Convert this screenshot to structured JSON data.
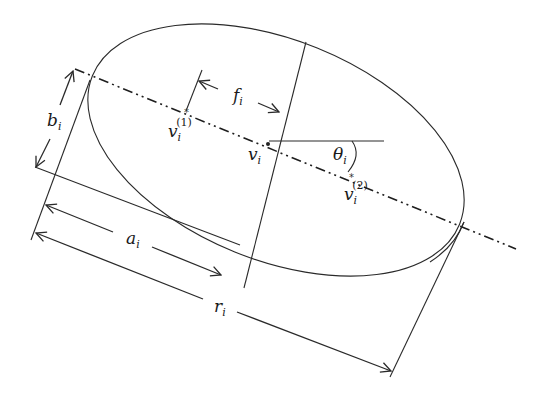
{
  "diagram": {
    "labels": {
      "b": {
        "base": "b",
        "sub": "i"
      },
      "f": {
        "base": "f",
        "sub": "i"
      },
      "v1": {
        "base": "v",
        "sub": "i",
        "sup": "(1)"
      },
      "v": {
        "base": "v",
        "sub": "i"
      },
      "theta": {
        "base": "θ",
        "sub": "i"
      },
      "v2": {
        "base": "v",
        "sub": "i",
        "sup": "(2)"
      },
      "a": {
        "base": "a",
        "sub": "i"
      },
      "r": {
        "base": "r",
        "sub": "i"
      }
    },
    "colors": {
      "line": "#2a2a2a",
      "background": "#ffffff"
    }
  }
}
